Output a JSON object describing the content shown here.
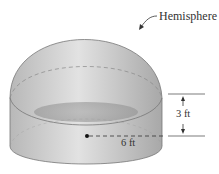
{
  "figure": {
    "labels": {
      "hemisphere": "Hemisphere",
      "height": "3 ft",
      "radius": "6 ft"
    },
    "colors": {
      "solid_fill": "#c8c8c8",
      "solid_dark": "#9a9a9a",
      "line": "#555555"
    }
  }
}
